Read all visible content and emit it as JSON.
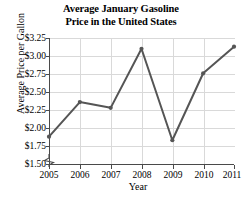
{
  "chart_data": {
    "type": "line",
    "title": "Average January Gasoline Price in the United States",
    "title_line1": "Average January Gasoline",
    "title_line2": "Price in the United States",
    "xlabel": "Year",
    "ylabel": "Average Price per Gallon",
    "categories": [
      "2005",
      "2006",
      "2007",
      "2008",
      "2009",
      "2010",
      "2011"
    ],
    "x": [
      2005,
      2006,
      2007,
      2008,
      2009,
      2010,
      2011
    ],
    "values": [
      1.88,
      2.36,
      2.28,
      3.1,
      1.83,
      2.76,
      3.13
    ],
    "series": [
      {
        "name": "Average January Gasoline Price",
        "values": [
          1.88,
          2.36,
          2.28,
          3.1,
          1.83,
          2.76,
          3.13
        ]
      }
    ],
    "ylim": [
      1.5,
      3.25
    ],
    "xlim": [
      2005,
      2011
    ],
    "ytick_labels": [
      "$1.50",
      "$1.75",
      "$2.00",
      "$2.25",
      "$2.50",
      "$2.75",
      "$3.00",
      "$3.25"
    ],
    "ytick_values": [
      1.5,
      1.75,
      2.0,
      2.25,
      2.5,
      2.75,
      3.0,
      3.25
    ],
    "xtick_labels": [
      "2005",
      "2006",
      "2007",
      "2008",
      "2009",
      "2010",
      "2011"
    ],
    "grid": true,
    "legend": "none",
    "axis_break": true,
    "line_color": "#555555",
    "grid_color": "#d9d9d9",
    "axis_color": "#4a4a4a",
    "marker": "circle"
  }
}
